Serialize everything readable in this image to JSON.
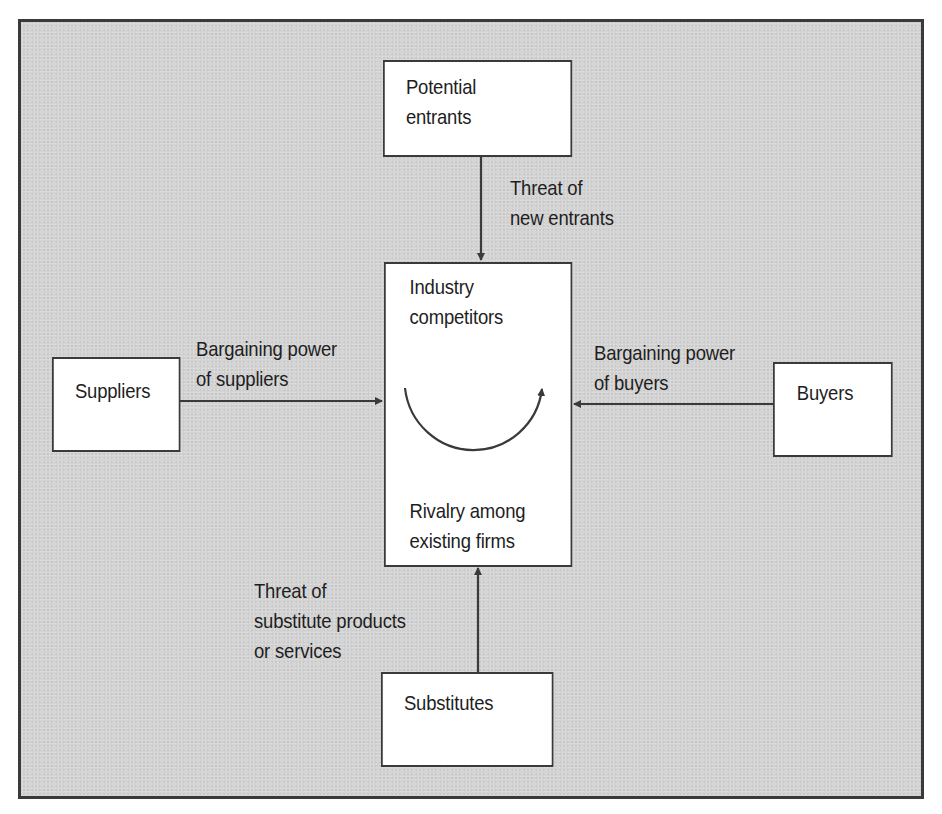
{
  "diagram": {
    "nodes": {
      "potential_entrants": {
        "line1": "Potential",
        "line2": "entrants"
      },
      "industry": {
        "top_line1": "Industry",
        "top_line2": "competitors",
        "bottom_line1": "Rivalry among",
        "bottom_line2": "existing firms"
      },
      "suppliers": {
        "label": "Suppliers"
      },
      "buyers": {
        "label": "Buyers"
      },
      "substitutes": {
        "label": "Substitutes"
      }
    },
    "edges": {
      "new_entrants": {
        "line1": "Threat of",
        "line2": "new entrants"
      },
      "suppliers_power": {
        "line1": "Bargaining power",
        "line2": "of suppliers"
      },
      "buyers_power": {
        "line1": "Bargaining power",
        "line2": "of buyers"
      },
      "substitutes_threat": {
        "line1": "Threat of",
        "line2": "substitute products",
        "line3": "or services"
      }
    }
  },
  "colors": {
    "background": "#d4d4d4",
    "box_fill": "#ffffff",
    "stroke": "#3a3a3a",
    "text": "#1e1e1e"
  }
}
